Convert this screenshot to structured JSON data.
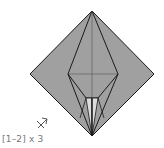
{
  "diagram": {
    "type": "origami-step",
    "repeat_label": "[1–2] x 3",
    "arrow_symbol": "turn-over-arrow",
    "colors": {
      "paper": "#a0a0a0",
      "inner_flap": "#dcdcdc",
      "lines": "#1a1a1a",
      "label": "#777777"
    }
  }
}
